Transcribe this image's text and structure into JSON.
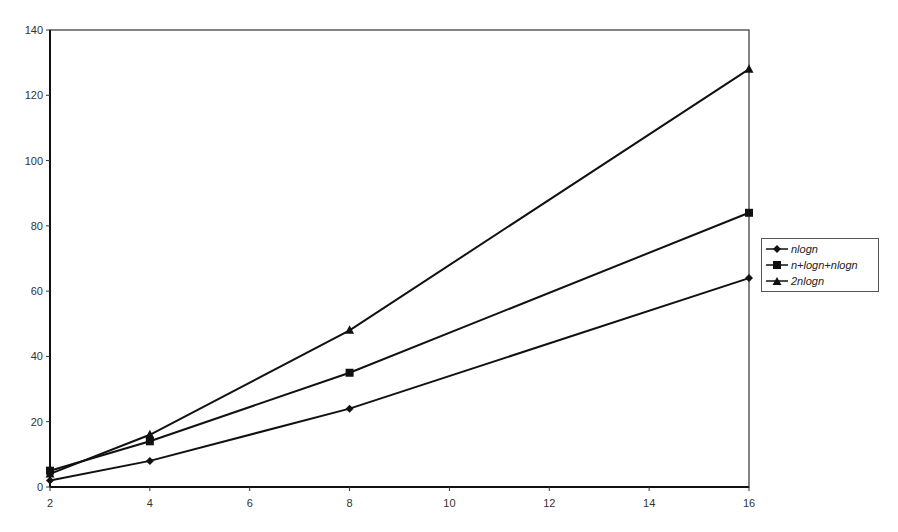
{
  "chart_data": {
    "type": "line",
    "title": "",
    "xlabel": "",
    "ylabel": "",
    "x": [
      2,
      4,
      8,
      16
    ],
    "xlim": [
      2,
      16
    ],
    "ylim": [
      0,
      140
    ],
    "x_ticks": [
      2,
      4,
      6,
      8,
      10,
      12,
      14,
      16
    ],
    "y_ticks": [
      0,
      20,
      40,
      60,
      80,
      100,
      120,
      140
    ],
    "grid": false,
    "legend_position": "right",
    "series": [
      {
        "name": "nlogn",
        "label": "n log n",
        "marker": "diamond",
        "color": "#111111",
        "values": [
          2,
          8,
          24,
          64
        ]
      },
      {
        "name": "n+logn+nlogn",
        "label": "n+log n+n log n",
        "marker": "square",
        "color": "#111111",
        "values": [
          5,
          14,
          35,
          84
        ]
      },
      {
        "name": "2nlogn",
        "label": "2 n log n",
        "marker": "triangle",
        "color": "#111111",
        "values": [
          4,
          16,
          48,
          128
        ]
      }
    ]
  },
  "legend": {
    "items": [
      {
        "label": "nlogn",
        "marker": "diamond"
      },
      {
        "label": "n+logn+nlogn",
        "marker": "square"
      },
      {
        "label": "2nlogn",
        "marker": "triangle"
      }
    ]
  }
}
